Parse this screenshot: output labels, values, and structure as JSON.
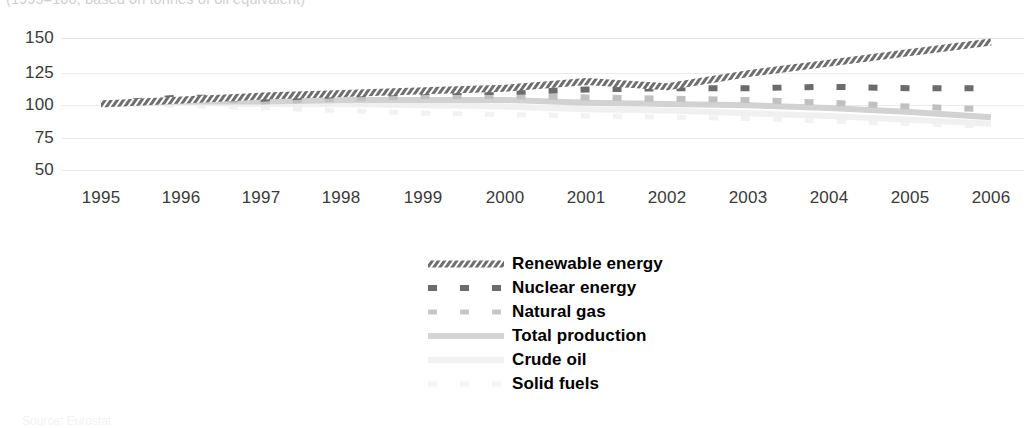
{
  "subtitle": "(1995=100, based on tonnes of oil equivalent)",
  "footer_note": "Source: Eurostat",
  "axes": {
    "y_ticks": [
      "150",
      "125",
      "100",
      "75",
      "50"
    ],
    "x_ticks": [
      "1995",
      "1996",
      "1997",
      "1998",
      "1999",
      "2000",
      "2001",
      "2002",
      "2003",
      "2004",
      "2005",
      "2006"
    ]
  },
  "legend": {
    "items": [
      {
        "label": "Renewable energy",
        "style": "hatched-thick",
        "color": "#5a5a5a"
      },
      {
        "label": "Nuclear energy",
        "style": "dashed-long",
        "color": "#6b6b6b"
      },
      {
        "label": "Natural gas",
        "style": "dashed-long",
        "color": "#c0c0c0"
      },
      {
        "label": "Total production",
        "style": "solid-thick",
        "color": "#d2d2d2"
      },
      {
        "label": "Crude oil",
        "style": "solid-faint",
        "color": "#f0f0f0"
      },
      {
        "label": "Solid fuels",
        "style": "dashed-faint",
        "color": "#f2f2f2"
      }
    ]
  },
  "chart_data": {
    "type": "line",
    "title": "",
    "subtitle": "(1995=100, based on tonnes of oil equivalent)",
    "xlabel": "",
    "ylabel": "",
    "ylim": [
      50,
      150
    ],
    "ygrid": true,
    "legend_position": "bottom-center",
    "x": [
      1995,
      1996,
      1997,
      1998,
      1999,
      2000,
      2001,
      2002,
      2003,
      2004,
      2005,
      2006
    ],
    "series": [
      {
        "name": "Renewable energy",
        "color": "#5a5a5a",
        "style": "hatched-thick",
        "values": [
          100,
          103,
          106,
          108,
          110,
          112,
          117,
          113,
          123,
          131,
          139,
          147
        ]
      },
      {
        "name": "Nuclear energy",
        "color": "#6b6b6b",
        "style": "dashed-long",
        "values": [
          100,
          105,
          104,
          107,
          109,
          109,
          111,
          112,
          112,
          113,
          112,
          112
        ]
      },
      {
        "name": "Natural gas",
        "color": "#c0c0c0",
        "style": "dashed-long",
        "values": [
          100,
          105,
          102,
          104,
          106,
          106,
          105,
          104,
          103,
          101,
          98,
          96
        ]
      },
      {
        "name": "Total production",
        "color": "#d2d2d2",
        "style": "solid-thick",
        "values": [
          100,
          102,
          102,
          103,
          103,
          103,
          101,
          100,
          99,
          97,
          94,
          90
        ]
      },
      {
        "name": "Crude oil",
        "color": "#f0f0f0",
        "style": "solid-faint",
        "values": [
          100,
          101,
          100,
          100,
          99,
          98,
          96,
          95,
          93,
          91,
          88,
          85
        ]
      },
      {
        "name": "Solid fuels",
        "color": "#f2f2f2",
        "style": "dashed-faint",
        "values": [
          100,
          99,
          97,
          95,
          93,
          92,
          91,
          90,
          89,
          87,
          85,
          83
        ]
      }
    ]
  }
}
